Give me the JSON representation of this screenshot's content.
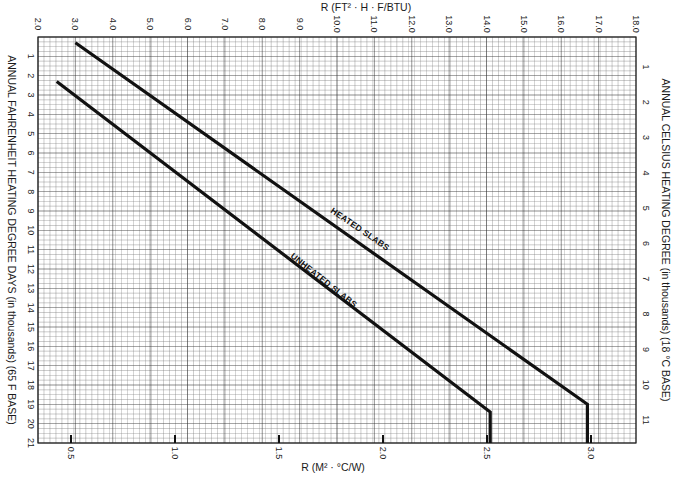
{
  "chart_data": {
    "type": "line",
    "title": "",
    "top_axis": {
      "label": "R (FT² · H · F/BTU)",
      "ticks": [
        "2.0",
        "3.0",
        "4.0",
        "5.0",
        "6.0",
        "7.0",
        "8.0",
        "9.0",
        "10.0",
        "11.0",
        "12.0",
        "13.0",
        "14.0",
        "15.0",
        "16.0",
        "17.0",
        "18.0"
      ],
      "range": [
        2.0,
        18.0
      ]
    },
    "bottom_axis": {
      "label": "R (M² · °C/W)",
      "ticks": [
        "0.5",
        "1.0",
        "1.5",
        "2.0",
        "2.5",
        "3.0"
      ],
      "range": [
        0.35,
        3.2
      ]
    },
    "left_axis": {
      "label": "ANNUAL FAHRENHEIT HEATING DEGREE DAYS (in thousands) (65 F BASE)",
      "ticks": [
        "1",
        "2",
        "3",
        "4",
        "5",
        "6",
        "7",
        "8",
        "9",
        "10",
        "11",
        "12",
        "13",
        "14",
        "15",
        "16",
        "17",
        "18",
        "19",
        "20",
        "21"
      ],
      "range": [
        0,
        21
      ]
    },
    "right_axis": {
      "label": "ANNUAL CELSIUS HEATING DEGREE (in thousands) (18 °C BASE)",
      "ticks": [
        "1",
        "2",
        "3",
        "4",
        "5",
        "6",
        "7",
        "8",
        "9",
        "10",
        "11"
      ],
      "range": [
        0,
        11.67
      ]
    },
    "grid": true,
    "xlabel": "R (M² · °C/W)",
    "ylabel": "ANNUAL FAHRENHEIT HEATING DEGREE DAYS (in thousands) (65 F BASE)",
    "series": [
      {
        "name": "HEATED SLABS",
        "points_r_ft2hF_btu_vs_fdd_thousands": [
          [
            3.0,
            0.3
          ],
          [
            16.7,
            19.0
          ],
          [
            16.7,
            21.0
          ]
        ]
      },
      {
        "name": "UNHEATED SLABS",
        "points_r_ft2hF_btu_vs_fdd_thousands": [
          [
            2.5,
            2.3
          ],
          [
            14.1,
            19.4
          ],
          [
            14.1,
            21.0
          ]
        ]
      }
    ]
  },
  "labels": {
    "top_axis_title": "R (FT² · H · F/BTU)",
    "bottom_axis_title": "R (M² · °C/W)",
    "left_axis_title": "ANNUAL FAHRENHEIT HEATING DEGREE DAYS (in thousands) (65 F BASE)",
    "right_axis_title": "ANNUAL CELSIUS HEATING DEGREE (in thousands) (18 °C BASE)",
    "heated": "HEATED SLABS",
    "unheated": "UNHEATED SLABS"
  },
  "colors": {
    "grid_minor": "#7a7a7a",
    "grid_major": "#2a2a2a",
    "line": "#111111",
    "background": "#ffffff"
  }
}
